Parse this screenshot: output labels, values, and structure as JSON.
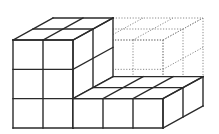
{
  "diagram": {
    "title": "",
    "colors": {
      "background": "#ffffff",
      "solid_line": "#2a2a2a",
      "dotted_line": "#8a8a8a"
    },
    "geometry": {
      "origin_front_top_left": [
        13,
        40
      ],
      "cube_width": 30,
      "cube_height": 29.33,
      "depth_unit": [
        20,
        -11
      ]
    },
    "blocks": [
      {
        "name": "tower",
        "style": "solid",
        "cols": [
          0,
          2
        ],
        "rows": [
          0,
          3
        ],
        "depth": 2
      },
      {
        "name": "bottom-row",
        "style": "solid",
        "cols": [
          2,
          5
        ],
        "rows": [
          2,
          3
        ],
        "depth": 2
      },
      {
        "name": "missing-block",
        "style": "dotted",
        "cols": [
          2,
          5
        ],
        "rows": [
          0,
          2
        ],
        "depth": 2
      }
    ]
  }
}
